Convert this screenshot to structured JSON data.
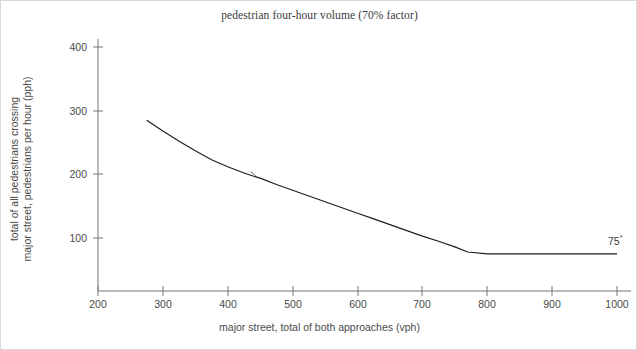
{
  "chart_data": {
    "type": "line",
    "title": "pedestrian four-hour volume (70% factor)",
    "xlabel": "major street, total of both approaches (vph)",
    "ylabel_line1": "total of all pedestrians crossing",
    "ylabel_line2": "major street, pedestrians per hour (pph)",
    "xlim": [
      200,
      1000
    ],
    "ylim": [
      0,
      430
    ],
    "xticks": [
      200,
      300,
      400,
      500,
      600,
      700,
      800,
      900,
      1000
    ],
    "yticks": [
      100,
      200,
      300,
      400
    ],
    "xtick_labels": [
      "200",
      "300",
      "400",
      "500",
      "600",
      "700",
      "800",
      "900",
      "1000"
    ],
    "ytick_labels": [
      "100",
      "200",
      "300",
      "400"
    ],
    "grid": false,
    "legend": "none",
    "series": [
      {
        "name": "pedestrian four-hour volume warrant curve",
        "x": [
          275,
          300,
          325,
          350,
          375,
          400,
          425,
          440,
          450,
          475,
          500,
          525,
          550,
          575,
          600,
          625,
          650,
          675,
          700,
          725,
          750,
          770,
          800,
          850,
          900,
          950,
          1000
        ],
        "values": [
          285,
          268,
          252,
          237,
          223,
          212,
          202,
          197,
          194,
          184,
          175,
          166,
          157,
          148,
          139,
          130,
          121,
          112,
          103,
          95,
          86,
          78,
          75,
          75,
          75,
          75,
          75
        ]
      }
    ],
    "annotations": [
      {
        "name": "floor-value-label",
        "text": "75",
        "superscript": "*",
        "x": 1000,
        "y": 75
      },
      {
        "name": "curve-tick-marker",
        "x": 440,
        "y": 200
      }
    ],
    "colors": {
      "curve": "#1d1d1d",
      "axis": "#777777",
      "text": "#4a4a4a",
      "title_text": "#3a3a3a",
      "background": "#ffffff",
      "border": "#d9d9d9"
    }
  }
}
